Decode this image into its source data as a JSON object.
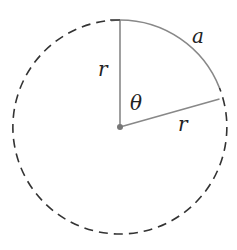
{
  "diagram": {
    "center": {
      "x": 120,
      "y": 127
    },
    "radius": 107,
    "labels": {
      "radius_vertical": "r",
      "radius_slanted": "r",
      "angle": "θ",
      "arc": "a"
    },
    "colors": {
      "dashed_circle": "#333333",
      "radii": "#888888",
      "arc": "#888888",
      "center_dot": "#777777",
      "text": "#222222"
    }
  }
}
